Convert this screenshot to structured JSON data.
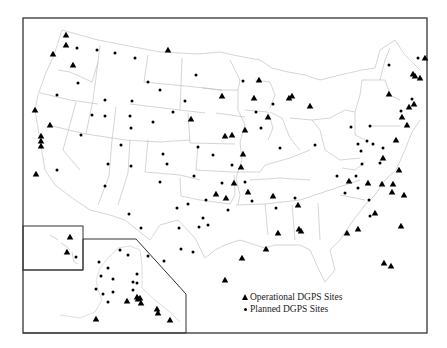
{
  "legend": {
    "operational_label": "Operational DGPS Sites",
    "planned_label": "Planned DGPS Sites"
  },
  "colors": {
    "marker": "#000000",
    "frame": "#333333",
    "state_lines": "#b8b8b8"
  },
  "frame": {
    "x": 23,
    "y": 18,
    "w": 404,
    "h": 315
  },
  "insets": {
    "hawaii": {
      "x": 23,
      "y": 226,
      "w": 60,
      "h": 44
    },
    "alaska_polygon": "23,270 83,270 83,239 136,239 186,294 186,333 23,333"
  },
  "operational_sites": [
    [
      66,
      35
    ],
    [
      66,
      45
    ],
    [
      53,
      54
    ],
    [
      73,
      65
    ],
    [
      35,
      110
    ],
    [
      50,
      125
    ],
    [
      41,
      136
    ],
    [
      41,
      141
    ],
    [
      41,
      146
    ],
    [
      191,
      119
    ],
    [
      222,
      96
    ],
    [
      168,
      50
    ],
    [
      259,
      80
    ],
    [
      254,
      98
    ],
    [
      289,
      98
    ],
    [
      245,
      130
    ],
    [
      268,
      117
    ],
    [
      292,
      96
    ],
    [
      310,
      106
    ],
    [
      225,
      136
    ],
    [
      232,
      135
    ],
    [
      234,
      183
    ],
    [
      216,
      194
    ],
    [
      226,
      198
    ],
    [
      243,
      154
    ],
    [
      241,
      167
    ],
    [
      248,
      192
    ],
    [
      273,
      196
    ],
    [
      278,
      233
    ],
    [
      266,
      249
    ],
    [
      242,
      258
    ],
    [
      225,
      280
    ],
    [
      298,
      205
    ],
    [
      301,
      231
    ],
    [
      299,
      229
    ],
    [
      349,
      181
    ],
    [
      347,
      233
    ],
    [
      358,
      229
    ],
    [
      375,
      213
    ],
    [
      393,
      184
    ],
    [
      399,
      170
    ],
    [
      404,
      195
    ],
    [
      392,
      192
    ],
    [
      391,
      266
    ],
    [
      382,
      184
    ],
    [
      384,
      263
    ],
    [
      401,
      226
    ],
    [
      402,
      117
    ],
    [
      396,
      140
    ],
    [
      383,
      158
    ],
    [
      389,
      94
    ],
    [
      407,
      125
    ],
    [
      414,
      104
    ],
    [
      415,
      76
    ],
    [
      420,
      78
    ],
    [
      425,
      58
    ],
    [
      413,
      74
    ],
    [
      409,
      107
    ],
    [
      368,
      183
    ],
    [
      36,
      174
    ],
    [
      70,
      237
    ],
    [
      67,
      252
    ],
    [
      96,
      319
    ],
    [
      127,
      301
    ],
    [
      138,
      299
    ],
    [
      137,
      297
    ],
    [
      157,
      309
    ],
    [
      158,
      313
    ],
    [
      170,
      320
    ],
    [
      140,
      298
    ],
    [
      141,
      303
    ]
  ],
  "planned_sites": [
    [
      77,
      48
    ],
    [
      97,
      50
    ],
    [
      115,
      53
    ],
    [
      135,
      58
    ],
    [
      148,
      82
    ],
    [
      78,
      83
    ],
    [
      57,
      95
    ],
    [
      105,
      100
    ],
    [
      132,
      101
    ],
    [
      105,
      116
    ],
    [
      92,
      115
    ],
    [
      81,
      135
    ],
    [
      130,
      116
    ],
    [
      153,
      122
    ],
    [
      131,
      128
    ],
    [
      163,
      154
    ],
    [
      121,
      145
    ],
    [
      108,
      164
    ],
    [
      57,
      170
    ],
    [
      131,
      166
    ],
    [
      167,
      164
    ],
    [
      198,
      147
    ],
    [
      213,
      155
    ],
    [
      185,
      101
    ],
    [
      196,
      75
    ],
    [
      160,
      90
    ],
    [
      173,
      112
    ],
    [
      243,
      81
    ],
    [
      273,
      104
    ],
    [
      256,
      112
    ],
    [
      261,
      128
    ],
    [
      232,
      165
    ],
    [
      222,
      183
    ],
    [
      245,
      182
    ],
    [
      280,
      148
    ],
    [
      315,
      145
    ],
    [
      295,
      198
    ],
    [
      276,
      208
    ],
    [
      252,
      201
    ],
    [
      228,
      210
    ],
    [
      206,
      200
    ],
    [
      160,
      182
    ],
    [
      177,
      208
    ],
    [
      179,
      228
    ],
    [
      181,
      249
    ],
    [
      199,
      227
    ],
    [
      203,
      218
    ],
    [
      194,
      176
    ],
    [
      208,
      225
    ],
    [
      193,
      252
    ],
    [
      188,
      204
    ],
    [
      164,
      261
    ],
    [
      148,
      256
    ],
    [
      99,
      262
    ],
    [
      105,
      186
    ],
    [
      129,
      214
    ],
    [
      141,
      228
    ],
    [
      356,
      176
    ],
    [
      351,
      127
    ],
    [
      358,
      144
    ],
    [
      367,
      141
    ],
    [
      361,
      151
    ],
    [
      362,
      164
    ],
    [
      337,
      176
    ],
    [
      345,
      193
    ],
    [
      369,
      200
    ],
    [
      370,
      216
    ],
    [
      358,
      188
    ],
    [
      370,
      126
    ],
    [
      373,
      144
    ],
    [
      380,
      163
    ],
    [
      383,
      148
    ],
    [
      401,
      111
    ],
    [
      389,
      65
    ],
    [
      412,
      99
    ],
    [
      418,
      58
    ],
    [
      76,
      257
    ],
    [
      120,
      250
    ],
    [
      128,
      255
    ],
    [
      108,
      268
    ],
    [
      101,
      276
    ],
    [
      113,
      279
    ],
    [
      137,
      274
    ],
    [
      133,
      282
    ],
    [
      137,
      283
    ],
    [
      96,
      289
    ],
    [
      103,
      294
    ],
    [
      113,
      292
    ],
    [
      133,
      290
    ],
    [
      108,
      302
    ]
  ],
  "state_lines": [
    "M62,30 L98,40 L160,52 L198,54 L220,52 L238,56 L260,60 L272,68 L288,72 L305,75 L320,80 L340,75 L362,70 L375,68 L380,50 L395,40 L405,55 L420,70",
    "M62,30 L54,55 L45,75 L38,95 L35,110 L40,140 L45,170 L55,185 L75,200 L90,210 L110,215 L125,220 L140,232 L150,240",
    "M150,240 L160,225 L178,220 L195,238 L205,258 L215,250 L225,245 L240,240 L265,248 L275,245 L300,245 L310,250 L318,268 L325,282 L335,270 L330,250 L340,240 L352,222 L365,205 L375,195 L385,180 L396,170 L405,150 L412,132 L420,120",
    "M100,45 L98,62 L92,82 L70,72 L58,70",
    "M40,93 L70,100 L98,104",
    "M98,62 L93,100 L86,134 L48,125",
    "M76,102 L63,150 L80,170",
    "M86,134 L125,140 L160,142 L190,140",
    "M116,107 L112,140 L109,176 L98,205",
    "M130,104 L180,110 L205,113",
    "M148,55 L144,82 L205,88 L222,90",
    "M182,58 L180,110",
    "M148,140 L145,172 L180,175 L200,180",
    "M130,140 L128,173 L118,205",
    "M188,113 L190,143 L235,144",
    "M198,145 L196,170 L232,172",
    "M180,178 L181,196 L200,200 L230,204 L235,195 L234,175",
    "M202,88 L220,90 L238,90 L238,110 L245,125 L240,142",
    "M216,113 L245,117",
    "M230,60 L240,80 L238,90",
    "M240,142 L242,160 L236,178 L240,195 L238,205",
    "M232,172 L260,172 L265,165 L290,158 L310,150",
    "M245,110 L268,112 L273,128 L268,140",
    "M255,80 L270,82 L275,95 L270,108",
    "M270,112 L282,118 L290,138 L300,150",
    "M290,118 L312,120 L320,130",
    "M312,120 L330,118 L345,110 L355,112 L355,135 L365,140",
    "M320,130 L325,150 L340,160 L360,158",
    "M236,205 L265,204 L300,200 L330,190 L360,180",
    "M265,204 L268,235",
    "M292,205 L295,240",
    "M318,203 L320,240",
    "M250,180 L280,178 L310,180",
    "M342,168 L355,170 L365,162",
    "M355,112 L360,95 L362,80",
    "M362,80 L385,80 L390,95 L400,100",
    "M380,80 L385,60 L390,48",
    "M370,126 L400,126",
    "M340,195 L365,200"
  ],
  "hawaii_islands": "M50,235 L55,238 L58,240 M61,243 L66,246 L70,250 M72,252 L74,262 L78,264",
  "alaska_outline": "M60,315 L80,318 L95,312 L102,300 L98,290 L96,280 L100,268 L108,258 L118,248 L130,246 L140,250 L142,265 L142,288 L155,300 L170,312 L180,322"
}
